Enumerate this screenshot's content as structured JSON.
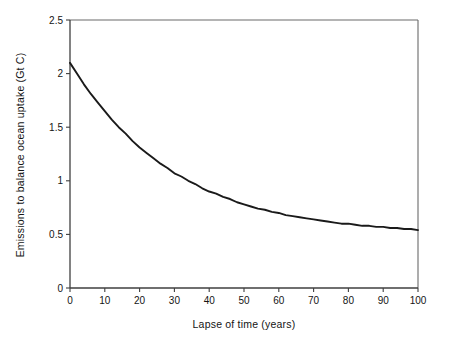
{
  "chart_data": {
    "type": "line",
    "title": "",
    "xlabel": "Lapse of time (years)",
    "ylabel": "Emissions to balance ocean uptake (Gt C)",
    "xlim": [
      0,
      100
    ],
    "ylim": [
      0,
      2.5
    ],
    "xticks": [
      0,
      10,
      20,
      30,
      40,
      50,
      60,
      70,
      80,
      90,
      100
    ],
    "xtick_labels": [
      "0",
      "10",
      "20",
      "30",
      "40",
      "50",
      "60",
      "70",
      "80",
      "90",
      "100"
    ],
    "yticks": [
      0,
      0.5,
      1,
      1.5,
      2,
      2.5
    ],
    "ytick_labels": [
      "0",
      "0.5",
      "1",
      "1.5",
      "2",
      "2.5"
    ],
    "grid": false,
    "legend": null,
    "series": [
      {
        "name": "Emissions to balance ocean uptake",
        "color": "#1a1a1a",
        "x": [
          0,
          2,
          4,
          6,
          8,
          10,
          12,
          14,
          16,
          18,
          20,
          22,
          24,
          26,
          28,
          30,
          32,
          34,
          36,
          38,
          40,
          42,
          44,
          46,
          48,
          50,
          52,
          54,
          56,
          58,
          60,
          62,
          64,
          66,
          68,
          70,
          72,
          74,
          76,
          78,
          80,
          82,
          84,
          86,
          88,
          90,
          92,
          94,
          96,
          98,
          100
        ],
        "values": [
          2.1,
          2.0,
          1.9,
          1.81,
          1.73,
          1.65,
          1.57,
          1.5,
          1.44,
          1.37,
          1.31,
          1.26,
          1.21,
          1.16,
          1.12,
          1.07,
          1.04,
          1.0,
          0.97,
          0.93,
          0.9,
          0.88,
          0.85,
          0.83,
          0.8,
          0.78,
          0.76,
          0.74,
          0.73,
          0.71,
          0.7,
          0.68,
          0.67,
          0.66,
          0.65,
          0.64,
          0.63,
          0.62,
          0.61,
          0.6,
          0.6,
          0.59,
          0.58,
          0.58,
          0.57,
          0.57,
          0.56,
          0.56,
          0.55,
          0.55,
          0.54
        ]
      }
    ],
    "annotations": []
  },
  "axes": {
    "axis_color": "#444444",
    "frame_color": "#666666",
    "curve_color": "#1a1a1a"
  }
}
